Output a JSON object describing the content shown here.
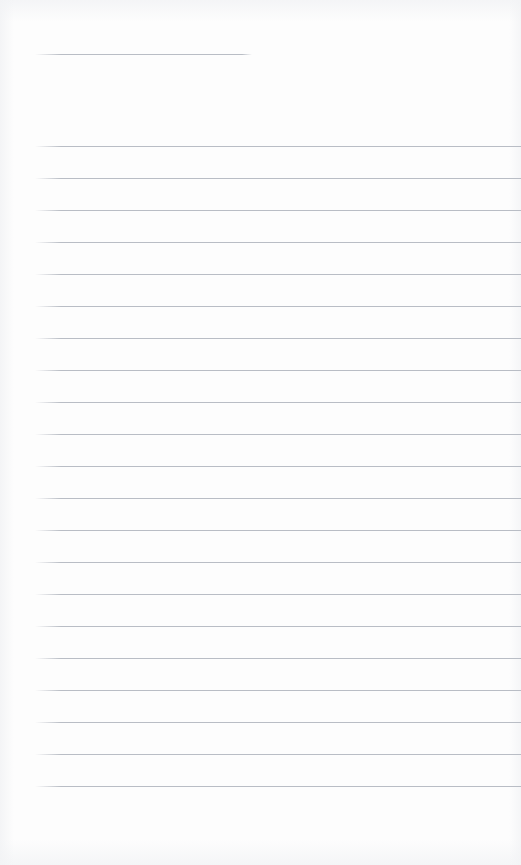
{
  "page": {
    "kind": "ruled-notebook-page",
    "width": 521,
    "height": 865,
    "background_color": "#fdfdfd",
    "content_text": "",
    "has_text_content": false
  },
  "ruling": {
    "line_color": "#b9bdc5",
    "line_thickness_px": 1,
    "line_spacing_px": 32,
    "left_margin_px": 35,
    "right_edge_px": 521,
    "first_full_line_y": 146,
    "last_full_line_y": 802,
    "full_line_count": 21,
    "header_rule": {
      "name": "title-rule",
      "y": 54,
      "x_start": 35,
      "x_end": 252,
      "width_px": 217
    }
  },
  "lines": [
    {
      "index": 0,
      "y": 54,
      "x": 35,
      "width": 217,
      "variant": "short"
    },
    {
      "index": 1,
      "y": 146,
      "x": 35,
      "width": 486,
      "variant": "full"
    },
    {
      "index": 2,
      "y": 178,
      "x": 35,
      "width": 486,
      "variant": "full"
    },
    {
      "index": 3,
      "y": 210,
      "x": 35,
      "width": 486,
      "variant": "full"
    },
    {
      "index": 4,
      "y": 242,
      "x": 35,
      "width": 486,
      "variant": "full"
    },
    {
      "index": 5,
      "y": 274,
      "x": 35,
      "width": 486,
      "variant": "full"
    },
    {
      "index": 6,
      "y": 306,
      "x": 35,
      "width": 486,
      "variant": "full"
    },
    {
      "index": 7,
      "y": 338,
      "x": 35,
      "width": 486,
      "variant": "full"
    },
    {
      "index": 8,
      "y": 370,
      "x": 35,
      "width": 486,
      "variant": "full"
    },
    {
      "index": 9,
      "y": 402,
      "x": 35,
      "width": 486,
      "variant": "full"
    },
    {
      "index": 10,
      "y": 434,
      "x": 35,
      "width": 486,
      "variant": "full"
    },
    {
      "index": 11,
      "y": 466,
      "x": 35,
      "width": 486,
      "variant": "full"
    },
    {
      "index": 12,
      "y": 498,
      "x": 35,
      "width": 486,
      "variant": "full"
    },
    {
      "index": 13,
      "y": 530,
      "x": 35,
      "width": 486,
      "variant": "full"
    },
    {
      "index": 14,
      "y": 562,
      "x": 35,
      "width": 486,
      "variant": "full"
    },
    {
      "index": 15,
      "y": 594,
      "x": 35,
      "width": 486,
      "variant": "full"
    },
    {
      "index": 16,
      "y": 626,
      "x": 35,
      "width": 486,
      "variant": "full"
    },
    {
      "index": 17,
      "y": 658,
      "x": 35,
      "width": 486,
      "variant": "full"
    },
    {
      "index": 18,
      "y": 690,
      "x": 35,
      "width": 486,
      "variant": "full"
    },
    {
      "index": 19,
      "y": 722,
      "x": 35,
      "width": 486,
      "variant": "full"
    },
    {
      "index": 20,
      "y": 754,
      "x": 35,
      "width": 486,
      "variant": "full"
    },
    {
      "index": 21,
      "y": 786,
      "x": 35,
      "width": 486,
      "variant": "full"
    }
  ]
}
